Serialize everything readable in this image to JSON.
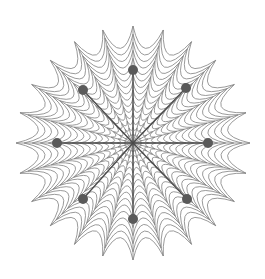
{
  "figure": {
    "name": "spider-web",
    "title": "Spider Web",
    "width": 265,
    "height": 279,
    "background_color": "#ffffff"
  },
  "chart_data": {
    "type": "scatter",
    "title": "Spider Web",
    "xlabel": "",
    "ylabel": "",
    "grid": true,
    "legend": false,
    "center": {
      "x": 133,
      "y": 143
    },
    "radius": 117,
    "spoke_count": 24,
    "ring_count": 15,
    "ring_innermost_radius": 9,
    "sag_factor": 0.18,
    "web_line_color": "#808080",
    "web_line_width": 0.8,
    "spoke_line_color": "#808080",
    "spoke_line_width": 0.8,
    "marker_color": "#5a5a5a",
    "marker_radius": 5,
    "marker_spoke_color": "#4a4a4a",
    "marker_spoke_width": 1.3,
    "markers": [
      {
        "label": "N",
        "angle_deg": 90,
        "radius": 73,
        "x": 133,
        "y": 70
      },
      {
        "label": "NE",
        "angle_deg": 45,
        "radius": 76,
        "x": 186,
        "y": 88
      },
      {
        "label": "E",
        "angle_deg": 0,
        "radius": 75,
        "x": 208,
        "y": 143
      },
      {
        "label": "SE",
        "angle_deg": 315,
        "radius": 76,
        "x": 187,
        "y": 199
      },
      {
        "label": "S",
        "angle_deg": 270,
        "radius": 76,
        "x": 133,
        "y": 219
      },
      {
        "label": "SW",
        "angle_deg": 225,
        "radius": 76,
        "x": 83,
        "y": 199
      },
      {
        "label": "W",
        "angle_deg": 180,
        "radius": 76,
        "x": 57,
        "y": 143
      },
      {
        "label": "NW",
        "angle_deg": 135,
        "radius": 76,
        "x": 83,
        "y": 90
      }
    ]
  }
}
